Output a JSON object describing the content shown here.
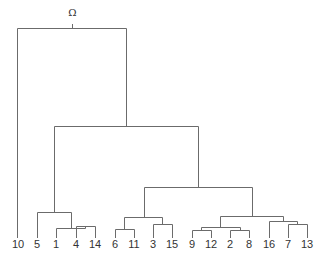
{
  "diagram": {
    "type": "dendrogram",
    "root_label": "Ω",
    "line_color": "#6b6b6b",
    "text_color": "#333333",
    "leaves": [
      {
        "label": "10",
        "x": 18
      },
      {
        "label": "5",
        "x": 37
      },
      {
        "label": "1",
        "x": 56
      },
      {
        "label": "4",
        "x": 76
      },
      {
        "label": "14",
        "x": 95
      },
      {
        "label": "6",
        "x": 115
      },
      {
        "label": "11",
        "x": 134
      },
      {
        "label": "3",
        "x": 153
      },
      {
        "label": "15",
        "x": 172
      },
      {
        "label": "9",
        "x": 192
      },
      {
        "label": "12",
        "x": 211
      },
      {
        "label": "2",
        "x": 230
      },
      {
        "label": "8",
        "x": 249
      },
      {
        "label": "16",
        "x": 269
      },
      {
        "label": "7",
        "x": 288
      },
      {
        "label": "13",
        "x": 307
      }
    ],
    "merges": [
      {
        "left_x": 76,
        "right_x": 95,
        "y": 226,
        "left_bottom": 238,
        "right_bottom": 238
      },
      {
        "left_x": 56,
        "right_x": 85,
        "y": 228,
        "left_bottom": 238,
        "right_bottom": 226
      },
      {
        "left_x": 37,
        "right_x": 71,
        "y": 212,
        "left_bottom": 238,
        "right_bottom": 228
      },
      {
        "left_x": 115,
        "right_x": 134,
        "y": 229,
        "left_bottom": 238,
        "right_bottom": 238
      },
      {
        "left_x": 153,
        "right_x": 172,
        "y": 224,
        "left_bottom": 238,
        "right_bottom": 238
      },
      {
        "left_x": 124,
        "right_x": 162,
        "y": 217,
        "left_bottom": 229,
        "right_bottom": 224
      },
      {
        "left_x": 192,
        "right_x": 211,
        "y": 230,
        "left_bottom": 238,
        "right_bottom": 238
      },
      {
        "left_x": 230,
        "right_x": 249,
        "y": 230,
        "left_bottom": 238,
        "right_bottom": 238
      },
      {
        "left_x": 201,
        "right_x": 240,
        "y": 227,
        "left_bottom": 230,
        "right_bottom": 230
      },
      {
        "left_x": 288,
        "right_x": 307,
        "y": 224,
        "left_bottom": 238,
        "right_bottom": 238
      },
      {
        "left_x": 269,
        "right_x": 297,
        "y": 221,
        "left_bottom": 238,
        "right_bottom": 224
      },
      {
        "left_x": 220,
        "right_x": 283,
        "y": 216,
        "left_bottom": 227,
        "right_bottom": 221
      },
      {
        "left_x": 144,
        "right_x": 252,
        "y": 187,
        "left_bottom": 217,
        "right_bottom": 216
      },
      {
        "left_x": 54,
        "right_x": 198,
        "y": 126,
        "left_bottom": 212,
        "right_bottom": 187
      },
      {
        "left_x": 17,
        "right_x": 126,
        "y": 28,
        "left_bottom": 238,
        "right_bottom": 126
      }
    ],
    "root": {
      "x": 72,
      "y": 28,
      "label_y": 16
    }
  }
}
